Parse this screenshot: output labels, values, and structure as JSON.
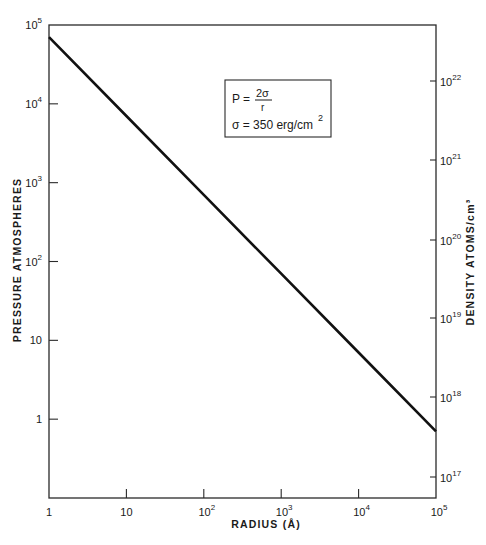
{
  "chart_data": {
    "type": "line",
    "title": "",
    "xlabel": "RADIUS (Å)",
    "ylabel": "PRESSURE ATMOSPHERES",
    "y2label": "DENSITY ATOMS/cm³",
    "xscale": "log",
    "yscale": "log",
    "xlim": [
      1,
      100000
    ],
    "ylim": [
      0.1,
      100000
    ],
    "y2lim_note": "right axis density in atoms/cm^3, log scale",
    "grid": false,
    "x_ticks": [
      {
        "value": 1,
        "label": "1"
      },
      {
        "value": 10,
        "label": "10"
      },
      {
        "value": 100,
        "base": "10",
        "exp": "2"
      },
      {
        "value": 1000,
        "base": "10",
        "exp": "3"
      },
      {
        "value": 10000,
        "base": "10",
        "exp": "4"
      },
      {
        "value": 100000,
        "base": "10",
        "exp": "5"
      }
    ],
    "y_ticks": [
      {
        "value": 1,
        "label": "1"
      },
      {
        "value": 10,
        "label": "10"
      },
      {
        "value": 100,
        "base": "10",
        "exp": "2"
      },
      {
        "value": 1000,
        "base": "10",
        "exp": "3"
      },
      {
        "value": 10000,
        "base": "10",
        "exp": "4"
      },
      {
        "value": 100000,
        "base": "10",
        "exp": "5"
      }
    ],
    "y2_ticks": [
      {
        "value": 1e+17,
        "base": "10",
        "exp": "17",
        "pixel_y": 477
      },
      {
        "value": 1e+18,
        "base": "10",
        "exp": "18",
        "pixel_y": 397
      },
      {
        "value": 1e+19,
        "base": "10",
        "exp": "19",
        "pixel_y": 318
      },
      {
        "value": 1e+20,
        "base": "10",
        "exp": "20",
        "pixel_y": 240
      },
      {
        "value": 1e+21,
        "base": "10",
        "exp": "21",
        "pixel_y": 160
      },
      {
        "value": 1e+22,
        "base": "10",
        "exp": "22",
        "pixel_y": 81
      }
    ],
    "series": [
      {
        "name": "P = 2σ/r",
        "x": [
          1,
          10,
          100,
          1000,
          10000,
          100000
        ],
        "y": [
          70000,
          7000,
          700,
          70,
          7,
          0.7
        ]
      }
    ],
    "annotations": {
      "formula_lhs": "P =",
      "formula_num": "2σ",
      "formula_den": "r",
      "sigma_line": "σ = 350 erg/cm",
      "sigma_exp": "2"
    },
    "legend_position": "upper-center-right (boxed)"
  }
}
